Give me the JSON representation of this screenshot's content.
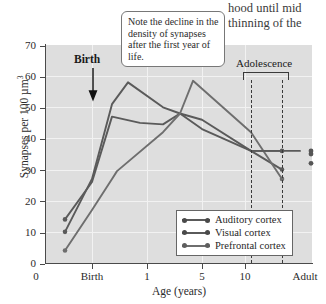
{
  "body_text": {
    "line1": "hood until mid",
    "line2": "thinning of the"
  },
  "callout": {
    "text": "Note the decline in the density of synapses after the first year of life."
  },
  "annotations": {
    "birth_label": "Birth",
    "adolescence_label": "Adolescence"
  },
  "chart_data": {
    "type": "line",
    "title": "",
    "xlabel": "Age (years)",
    "ylabel": "Synapses per 100 µm³",
    "ylim": [
      0,
      70
    ],
    "yticks": [
      0,
      10,
      20,
      30,
      40,
      50,
      60,
      70
    ],
    "xtick_labels": [
      "0",
      "Birth",
      "1",
      "5",
      "10",
      "Adult"
    ],
    "grid": true,
    "legend_position": "bottom-right",
    "x_axis_note": "Non-linear developmental age scale: conception to birth, then logarithmic years to adulthood.",
    "series": [
      {
        "name": "Auditory cortex",
        "color": "#5a5a5a",
        "points": [
          {
            "x_label": "prenatal",
            "y": 14
          },
          {
            "x_label": "birth",
            "y": 26
          },
          {
            "x_label": "0.3",
            "y": 47
          },
          {
            "x_label": "1",
            "y": 45
          },
          {
            "x_label": "2",
            "y": 44.5
          },
          {
            "x_label": "3",
            "y": 48
          },
          {
            "x_label": "5",
            "y": 46
          },
          {
            "x_label": "10",
            "y": 36
          },
          {
            "x_label": "14",
            "y": 36
          },
          {
            "x_label": "adult",
            "y": 36
          }
        ]
      },
      {
        "name": "Visual cortex",
        "color": "#5a5a5a",
        "points": [
          {
            "x_label": "prenatal",
            "y": 10
          },
          {
            "x_label": "birth",
            "y": 27
          },
          {
            "x_label": "0.3",
            "y": 51
          },
          {
            "x_label": "0.8",
            "y": 58
          },
          {
            "x_label": "2",
            "y": 50
          },
          {
            "x_label": "3",
            "y": 48
          },
          {
            "x_label": "5",
            "y": 43
          },
          {
            "x_label": "10",
            "y": 36
          },
          {
            "x_label": "14",
            "y": 30
          },
          {
            "x_label": "adult",
            "y": 35
          }
        ]
      },
      {
        "name": "Prefrontal cortex",
        "color": "#6e6e6e",
        "points": [
          {
            "x_label": "prenatal",
            "y": 4
          },
          {
            "x_label": "birth",
            "y": 17
          },
          {
            "x_label": "0.3",
            "y": 27
          },
          {
            "x_label": "0.6",
            "y": 29.5
          },
          {
            "x_label": "2",
            "y": 42
          },
          {
            "x_label": "3",
            "y": 48
          },
          {
            "x_label": "4",
            "y": 58.5
          },
          {
            "x_label": "10",
            "y": 42
          },
          {
            "x_label": "14",
            "y": 27
          },
          {
            "x_label": "adult",
            "y": 32
          }
        ]
      }
    ],
    "adult_points": [
      {
        "series": "Auditory cortex",
        "y": 36
      },
      {
        "series": "Visual cortex",
        "y": 35
      },
      {
        "series": "Prefrontal cortex",
        "y": 32
      }
    ],
    "adolescence_band": {
      "start_label": "10",
      "end_label": "14"
    }
  },
  "colors": {
    "panel_background": "#dedede",
    "gridline": "#f2f2f2",
    "line_dark": "#5a5a5a",
    "line_mid": "#6e6e6e",
    "axis": "#4a4a4a"
  }
}
